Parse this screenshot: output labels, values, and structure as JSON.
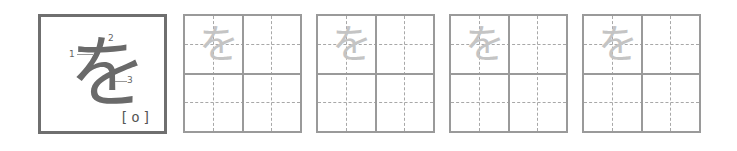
{
  "model": {
    "character": "を",
    "romaji": "[o]",
    "stroke_numbers": [
      "1",
      "2",
      "3"
    ]
  },
  "practice": {
    "boxes": [
      {
        "trace_char": "を"
      },
      {
        "trace_char": "を"
      },
      {
        "trace_char": "を"
      },
      {
        "trace_char": "を"
      }
    ]
  },
  "colors": {
    "border": "#6f6f6f",
    "grid": "#9a9a9a",
    "trace": "#c4c4c4"
  }
}
